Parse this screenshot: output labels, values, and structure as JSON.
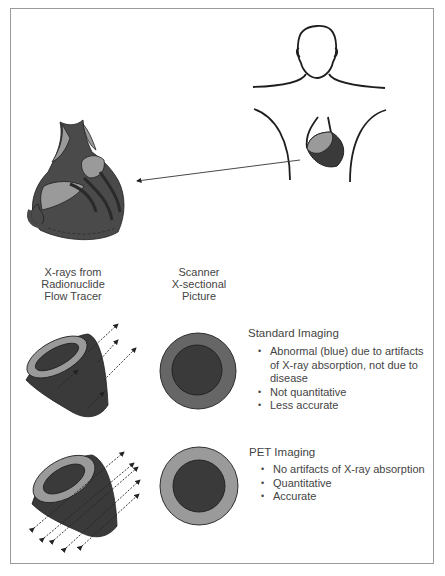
{
  "figure": {
    "colors": {
      "dark": "#3a3a3a",
      "mid": "#666666",
      "light": "#9a9a9a",
      "outline": "#1e1e1e",
      "border": "#9a9a9a"
    },
    "icons": {
      "torso": "human-torso-outline-icon",
      "heart_small": "heart-in-chest-icon",
      "heart_large": "heart-anatomy-icon",
      "pointer_arrow": "arrow-left-icon"
    },
    "column_labels": {
      "left": [
        "X-rays from",
        "Radionuclide",
        "Flow Tracer"
      ],
      "right": [
        "Scanner",
        "X-sectional",
        "Picture"
      ]
    },
    "standard": {
      "title": "Standard Imaging",
      "bullets": [
        "Abnormal (blue) due to artifacts of X-ray absorption, not due to disease",
        "Not quantitative",
        "Less accurate"
      ]
    },
    "pet": {
      "title": "PET Imaging",
      "bullets": [
        "No artifacts of X-ray absorption",
        "Quantitative",
        "Accurate"
      ]
    }
  }
}
